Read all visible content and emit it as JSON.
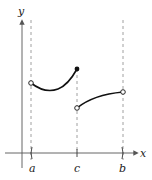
{
  "diagram": {
    "type": "piecewise-function-graph",
    "axes": {
      "x_label": "x",
      "y_label": "y"
    },
    "ticks": [
      {
        "label": "a",
        "x": 31
      },
      {
        "label": "c",
        "x": 77
      },
      {
        "label": "b",
        "x": 123
      }
    ],
    "pieces": [
      {
        "name": "left-piece",
        "start": {
          "point": "a",
          "endpoint": "open"
        },
        "end": {
          "point": "c",
          "endpoint": "closed"
        },
        "shape": "dips then rises"
      },
      {
        "name": "right-piece",
        "start": {
          "point": "c",
          "endpoint": "open"
        },
        "end": {
          "point": "b",
          "endpoint": "open"
        },
        "shape": "increasing, concave down"
      }
    ],
    "colors": {
      "curve": "#111111",
      "axis": "#555555",
      "dashed": "#888888"
    }
  }
}
